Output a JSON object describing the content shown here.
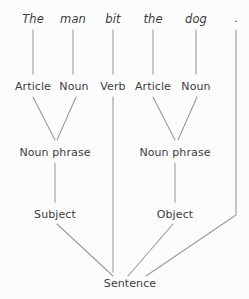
{
  "diagram": {
    "sentence": "The man bit the dog .",
    "background_color": "#fcfcfc",
    "line_color": "#9a9a9a",
    "text_color": "#3d3d3d",
    "levels": {
      "words": "words",
      "parts_of_speech": "parts of speech",
      "phrases": "phrases",
      "roles": "roles",
      "root": "root"
    },
    "nodes": [
      {
        "id": "w1",
        "label": "The",
        "level": "words",
        "x": 33,
        "y": 12,
        "italic": true
      },
      {
        "id": "w2",
        "label": "man",
        "level": "words",
        "x": 73,
        "y": 12,
        "italic": true
      },
      {
        "id": "w3",
        "label": "bit",
        "level": "words",
        "x": 113,
        "y": 12,
        "italic": true
      },
      {
        "id": "w4",
        "label": "the",
        "level": "words",
        "x": 153,
        "y": 12,
        "italic": true
      },
      {
        "id": "w5",
        "label": "dog",
        "level": "words",
        "x": 196,
        "y": 12,
        "italic": true
      },
      {
        "id": "w6",
        "label": ".",
        "level": "words",
        "x": 236,
        "y": 12,
        "italic": false
      },
      {
        "id": "p1",
        "label": "Article",
        "level": "parts_of_speech",
        "x": 33,
        "y": 80,
        "italic": false
      },
      {
        "id": "p2",
        "label": "Noun",
        "level": "parts_of_speech",
        "x": 74,
        "y": 80,
        "italic": false
      },
      {
        "id": "p3",
        "label": "Verb",
        "level": "parts_of_speech",
        "x": 113,
        "y": 80,
        "italic": false
      },
      {
        "id": "p4",
        "label": "Article",
        "level": "parts_of_speech",
        "x": 153,
        "y": 80,
        "italic": false
      },
      {
        "id": "p5",
        "label": "Noun",
        "level": "parts_of_speech",
        "x": 196,
        "y": 80,
        "italic": false
      },
      {
        "id": "n1",
        "label": "Noun phrase",
        "level": "phrases",
        "x": 55,
        "y": 146,
        "italic": false
      },
      {
        "id": "n2",
        "label": "Noun phrase",
        "level": "phrases",
        "x": 175,
        "y": 146,
        "italic": false
      },
      {
        "id": "r1",
        "label": "Subject",
        "level": "roles",
        "x": 55,
        "y": 208,
        "italic": false
      },
      {
        "id": "r2",
        "label": "Object",
        "level": "roles",
        "x": 175,
        "y": 208,
        "italic": false
      },
      {
        "id": "s1",
        "label": "Sentence",
        "level": "root",
        "x": 130,
        "y": 277,
        "italic": false
      }
    ],
    "edges": [
      {
        "from": "w1",
        "to": "p1",
        "points": [
          [
            33,
            30
          ],
          [
            33,
            74
          ]
        ]
      },
      {
        "from": "w2",
        "to": "p2",
        "points": [
          [
            73,
            30
          ],
          [
            73,
            74
          ]
        ]
      },
      {
        "from": "w3",
        "to": "p3",
        "points": [
          [
            113,
            30
          ],
          [
            113,
            74
          ]
        ]
      },
      {
        "from": "w4",
        "to": "p4",
        "points": [
          [
            153,
            30
          ],
          [
            153,
            74
          ]
        ]
      },
      {
        "from": "w5",
        "to": "p5",
        "points": [
          [
            196,
            30
          ],
          [
            196,
            74
          ]
        ]
      },
      {
        "from": "w6",
        "to": "s1",
        "points": [
          [
            236,
            30
          ],
          [
            236,
            215
          ],
          [
            146,
            276
          ]
        ]
      },
      {
        "from": "p1",
        "to": "n1",
        "points": [
          [
            33,
            97
          ],
          [
            55,
            140
          ]
        ]
      },
      {
        "from": "p2",
        "to": "n1",
        "points": [
          [
            76,
            97
          ],
          [
            57,
            140
          ]
        ]
      },
      {
        "from": "p4",
        "to": "n2",
        "points": [
          [
            153,
            97
          ],
          [
            175,
            140
          ]
        ]
      },
      {
        "from": "p5",
        "to": "n2",
        "points": [
          [
            197,
            97
          ],
          [
            178,
            140
          ]
        ]
      },
      {
        "from": "n1",
        "to": "r1",
        "points": [
          [
            55,
            163
          ],
          [
            55,
            202
          ]
        ]
      },
      {
        "from": "n2",
        "to": "r2",
        "points": [
          [
            175,
            163
          ],
          [
            175,
            202
          ]
        ]
      },
      {
        "from": "r1",
        "to": "s1",
        "points": [
          [
            57,
            224
          ],
          [
            113,
            276
          ]
        ]
      },
      {
        "from": "p3",
        "to": "s1",
        "points": [
          [
            113,
            97
          ],
          [
            113,
            272
          ]
        ]
      },
      {
        "from": "r2",
        "to": "s1",
        "points": [
          [
            173,
            224
          ],
          [
            128,
            276
          ]
        ]
      }
    ]
  }
}
